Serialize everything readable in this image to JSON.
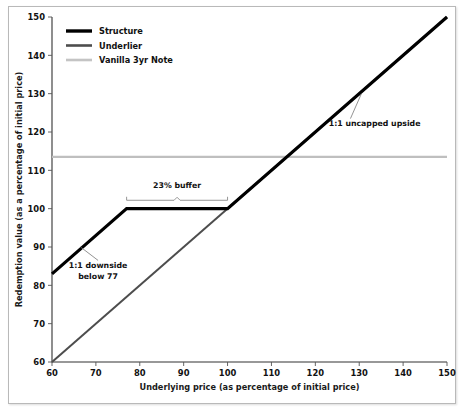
{
  "chart_data": {
    "type": "line",
    "title": "",
    "xlabel": "Underlying price (as percentage of initial price)",
    "ylabel": "Redemption value (as a percentage of initial price)",
    "xlim": [
      60,
      150
    ],
    "ylim": [
      60,
      150
    ],
    "xticks": [
      60,
      70,
      80,
      90,
      100,
      110,
      120,
      130,
      140,
      150
    ],
    "yticks": [
      60,
      70,
      80,
      90,
      100,
      110,
      120,
      130,
      140,
      150
    ],
    "grid": false,
    "legend_position": "top-left",
    "series": [
      {
        "name": "Structure",
        "color": "#000000",
        "width": 3.2,
        "points": [
          [
            60,
            83
          ],
          [
            77,
            100
          ],
          [
            100,
            100
          ],
          [
            150,
            150
          ]
        ]
      },
      {
        "name": "Underlier",
        "color": "#4d4d4d",
        "width": 2.0,
        "points": [
          [
            60,
            60
          ],
          [
            150,
            150
          ]
        ]
      },
      {
        "name": "Vanilla 3yr Note",
        "color": "#bfbfbf",
        "width": 2.2,
        "points": [
          [
            60,
            113.5
          ],
          [
            150,
            113.5
          ]
        ]
      }
    ],
    "annotations": [
      {
        "id": "buffer",
        "text": "23% buffer",
        "text_x": 88.5,
        "text_y": 105.5,
        "brace_from_x": 77,
        "brace_to_x": 100,
        "brace_y": 101.8
      },
      {
        "id": "downside",
        "text_line1": "1:1 downside",
        "text_line2": "below 77",
        "text_x": 70.5,
        "text_y": 84.5,
        "leader_from_x": 70.5,
        "leader_from_y": 86.5,
        "leader_to_x": 66.5,
        "leader_to_y": 90.0
      },
      {
        "id": "upside",
        "text": "1:1 uncapped upside",
        "text_x": 133.5,
        "text_y": 121.5,
        "leader_from_x": 128.0,
        "leader_from_y": 123.5,
        "leader_to_x": 130.5,
        "leader_to_y": 130.0
      }
    ]
  },
  "legend": {
    "items": [
      {
        "label": "Structure",
        "color": "#000000",
        "thickness": 3.4
      },
      {
        "label": "Underlier",
        "color": "#4d4d4d",
        "thickness": 2.6
      },
      {
        "label": "Vanilla 3yr Note",
        "color": "#c4c4c4",
        "thickness": 2.6
      }
    ]
  },
  "axes": {
    "x_tick_labels": [
      "60",
      "70",
      "80",
      "90",
      "100",
      "110",
      "120",
      "130",
      "140",
      "150"
    ],
    "y_tick_labels": [
      "60",
      "70",
      "80",
      "90",
      "100",
      "110",
      "120",
      "130",
      "140",
      "150"
    ],
    "x_title": "Underlying price (as percentage of initial price)",
    "y_title": "Redemption value (as a percentage of initial price)"
  }
}
